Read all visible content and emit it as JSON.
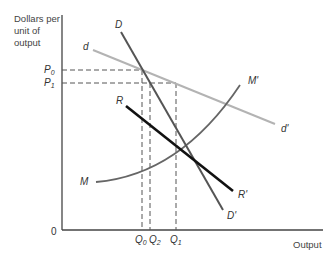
{
  "diagram": {
    "y_axis_label": [
      "Dollars per",
      "unit of",
      "output"
    ],
    "x_axis_label": "Output",
    "origin_label": "0",
    "price_labels": {
      "p0": "P",
      "p0_sub": "0",
      "p1": "P",
      "p1_sub": "1"
    },
    "quantity_labels": {
      "q0": "Q",
      "q0_sub": "0",
      "q2": "Q",
      "q2_sub": "2",
      "q1": "Q",
      "q1_sub": "1"
    },
    "curves": {
      "D": {
        "start": "D",
        "end": "D'",
        "color": "#555555"
      },
      "d": {
        "start": "d",
        "end": "d'",
        "color": "#b3b3b3"
      },
      "R": {
        "start": "R",
        "end": "R'",
        "color": "#111111"
      },
      "M": {
        "start": "M",
        "end": "M'",
        "color": "#666666"
      }
    }
  }
}
